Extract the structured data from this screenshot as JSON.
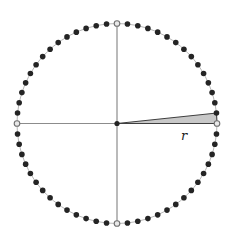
{
  "figure": {
    "background": "#ffffff"
  },
  "diagram": {
    "type": "dotted-circle-with-sector",
    "canvas": {
      "width": 234,
      "height": 238
    },
    "center": {
      "x": 117,
      "y": 123.5
    },
    "radius": 100,
    "outline": {
      "color": "#b8b8b8",
      "width": 1
    },
    "axes": {
      "color": "#8c8c8c",
      "width": 1.2
    },
    "points": {
      "count": 60,
      "angle_step_deg": 6,
      "dot_radius": 2.8,
      "filled_color": "#242424",
      "hollow_angles_deg": [
        0,
        90,
        180,
        270
      ],
      "hollow_fill": "#e9e9e9",
      "hollow_stroke": "#6f6f6f",
      "hollow_stroke_width": 1.1
    },
    "center_dot": {
      "radius": 2.6,
      "color": "#242424"
    },
    "sector": {
      "from_deg": 0,
      "to_deg": 6,
      "fill": "#c8c8c8",
      "stroke": "#3f3f3f",
      "stroke_width": 1,
      "label": {
        "text": "r",
        "x": 184,
        "y": 140,
        "font_size": 13,
        "color": "#222222"
      }
    }
  }
}
